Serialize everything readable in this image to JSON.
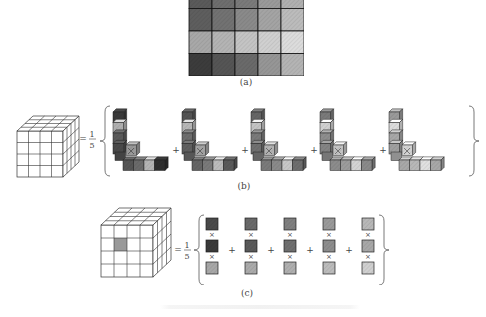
{
  "figure": {
    "panels": [
      {
        "id": "a",
        "label": "(a)",
        "description": "5-column grid of hatched grayscale cells (top row partially cropped)",
        "grid": {
          "cols": 5,
          "rows": [
            [
              "#5a5a5a",
              "#6e6e6e",
              "#7a7a7a",
              "#9a9a9a",
              "#b0b0b0"
            ],
            [
              "#5e5e5e",
              "#727272",
              "#8a8a8a",
              "#a4a4a4",
              "#bcbcbc"
            ],
            [
              "#a8a8a8",
              "#b4b4b4",
              "#c4c4c4",
              "#d0d0d0",
              "#dcdcdc"
            ],
            [
              "#3c3c3c",
              "#555555",
              "#6a6a6a",
              "#969696",
              "#b4b4b4"
            ]
          ]
        }
      },
      {
        "id": "b",
        "label": "(b)",
        "equation_lhs": "4x4x4 cube",
        "fraction": {
          "numerator": "1",
          "denominator": "5"
        },
        "operator": "+",
        "terms": [
          {
            "vertical": [
              "#3a3a3a",
              "#b0b0b0",
              "#5a5a5a",
              "#4a4a4a"
            ],
            "corner": "#9a9a9a",
            "horizontal": [
              "#555555",
              "#6a6a6a",
              "#b4b4b4",
              "#2e2e2e"
            ]
          },
          {
            "vertical": [
              "#555555",
              "#b8b8b8",
              "#6e6e6e",
              "#606060"
            ],
            "corner": "#a4a4a4",
            "horizontal": [
              "#666666",
              "#7a7a7a",
              "#bcbcbc",
              "#5a5a5a"
            ]
          },
          {
            "vertical": [
              "#666666",
              "#c4c4c4",
              "#7a7a7a",
              "#707070"
            ],
            "corner": "#b4b4b4",
            "horizontal": [
              "#7a7a7a",
              "#8a8a8a",
              "#c8c8c8",
              "#6e6e6e"
            ]
          },
          {
            "vertical": [
              "#7a7a7a",
              "#d0d0d0",
              "#8e8e8e",
              "#848484"
            ],
            "corner": "#c4c4c4",
            "horizontal": [
              "#8c8c8c",
              "#9c9c9c",
              "#d4d4d4",
              "#8a8a8a"
            ]
          },
          {
            "vertical": [
              "#9a9a9a",
              "#dcdcdc",
              "#a8a8a8",
              "#a0a0a0"
            ],
            "corner": "#d4d4d4",
            "horizontal": [
              "#a8a8a8",
              "#b8b8b8",
              "#e0e0e0",
              "#a8a8a8"
            ]
          }
        ]
      },
      {
        "id": "c",
        "label": "(c)",
        "equation_lhs": "4x4x4 cube with highlighted cell",
        "highlight_color": "#999999",
        "fraction": {
          "numerator": "1",
          "denominator": "5"
        },
        "operator": "+",
        "times": "×",
        "terms": [
          [
            "#4a4a4a",
            "#3a3a3a",
            "#a8a8a8"
          ],
          [
            "#6a6a6a",
            "#5a5a5a",
            "#ababab"
          ],
          [
            "#808080",
            "#707070",
            "#b0b0b0"
          ],
          [
            "#9a9a9a",
            "#8e8e8e",
            "#bcbcbc"
          ],
          [
            "#b8b8b8",
            "#a8a8a8",
            "#d0d0d0"
          ]
        ]
      }
    ]
  }
}
